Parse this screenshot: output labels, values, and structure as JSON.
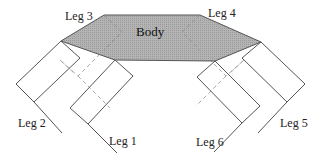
{
  "diagram": {
    "body_label": "Body",
    "legs": [
      {
        "id": 1,
        "label": "Leg 1",
        "side": "left",
        "position": "front-lower",
        "visible": true
      },
      {
        "id": 2,
        "label": "Leg 2",
        "side": "left",
        "position": "outer",
        "visible": true
      },
      {
        "id": 3,
        "label": "Leg 3",
        "side": "left",
        "position": "rear-hidden",
        "visible": false
      },
      {
        "id": 4,
        "label": "Leg 4",
        "side": "right",
        "position": "rear-hidden",
        "visible": false
      },
      {
        "id": 5,
        "label": "Leg 5",
        "side": "right",
        "position": "outer",
        "visible": true
      },
      {
        "id": 6,
        "label": "Leg 6",
        "side": "right",
        "position": "front-lower",
        "visible": true
      }
    ],
    "colors": {
      "body_fill": "#a9a9a9",
      "outline": "#555555",
      "hidden_dashed": "#aaaaaa",
      "background": "#ffffff"
    }
  }
}
